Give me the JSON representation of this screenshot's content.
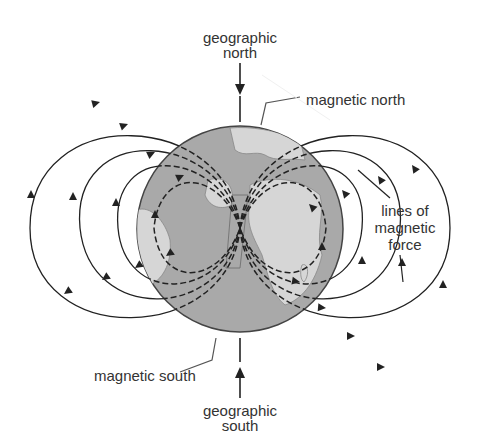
{
  "diagram": {
    "labels": {
      "geographic_north_line1": "geographic",
      "geographic_north_line2": "north",
      "magnetic_north": "magnetic north",
      "lines_of_force_line1": "lines of",
      "lines_of_force_line2": "magnetic",
      "lines_of_force_line3": "force",
      "magnetic_south": "magnetic south",
      "geographic_south_line1": "geographic",
      "geographic_south_line2": "south"
    },
    "colors": {
      "globe_ocean": "#a9a9a9",
      "globe_land": "#d6d6d6",
      "line": "#333333",
      "text": "#333333",
      "background": "#ffffff"
    },
    "globe": {
      "cx": 240,
      "cy": 229,
      "r": 103
    },
    "field_lines": {
      "dashed_inside_globe": true,
      "solid_outside_globe": true,
      "loops_per_side": 4
    }
  }
}
